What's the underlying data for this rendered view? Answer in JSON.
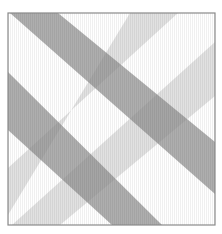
{
  "image": {
    "description": "Watercolor-style plaid pattern of crossing diagonal gray bands inside a thin square frame",
    "colors": {
      "background": "#ffffff",
      "frame": "#8a8a8a",
      "dark_band": "#8c8c8c",
      "light_band": "#c8c8c8"
    },
    "frame": {
      "x": 8,
      "y": 13,
      "width": 207,
      "height": 212
    },
    "bands": [
      {
        "name": "dark-band-upper",
        "tone": "dark",
        "points": "10,13 58,13 215,142 215,194"
      },
      {
        "name": "dark-band-lower",
        "tone": "dark",
        "points": "8,72 8,130 112,225 162,225"
      },
      {
        "name": "light-band-upper",
        "tone": "light",
        "points": "130,13 178,13 8,168 8,215"
      },
      {
        "name": "light-band-lower",
        "tone": "light",
        "points": "215,42 215,96 60,225 12,225"
      }
    ]
  }
}
